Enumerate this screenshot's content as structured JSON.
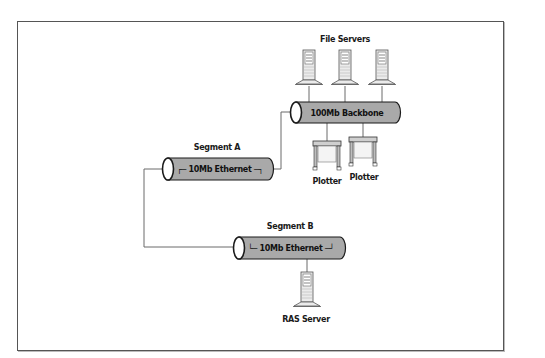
{
  "diagram": {
    "colors": {
      "pipe_fill": "#a9a9a9",
      "pipe_stroke": "#1a1a1a",
      "line": "#666666",
      "device_fill": "#e6e6e6",
      "frame": "#555555"
    },
    "groups": {
      "file_servers": {
        "label": "File Servers"
      }
    },
    "segments": [
      {
        "id": "backbone",
        "name_label": "",
        "pipe_label": "100Mb Backbone"
      },
      {
        "id": "segment_a",
        "name_label": "Segment A",
        "pipe_label": "┌─ 10Mb Ethernet ─┐"
      },
      {
        "id": "segment_b",
        "name_label": "Segment B",
        "pipe_label": "└─ 10Mb Ethernet ─┘"
      }
    ],
    "devices": [
      {
        "id": "file_server_1",
        "type": "server-icon",
        "label": ""
      },
      {
        "id": "file_server_2",
        "type": "server-icon",
        "label": ""
      },
      {
        "id": "file_server_3",
        "type": "server-icon",
        "label": ""
      },
      {
        "id": "plotter_1",
        "type": "plotter-icon",
        "label": "Plotter"
      },
      {
        "id": "plotter_2",
        "type": "plotter-icon",
        "label": "Plotter"
      },
      {
        "id": "ras_server",
        "type": "server-icon",
        "label": "RAS Server"
      }
    ],
    "connections": [
      {
        "from": "file_server_1",
        "to": "backbone"
      },
      {
        "from": "file_server_2",
        "to": "backbone"
      },
      {
        "from": "file_server_3",
        "to": "backbone"
      },
      {
        "from": "plotter_1",
        "to": "backbone"
      },
      {
        "from": "plotter_2",
        "to": "backbone"
      },
      {
        "from": "segment_a",
        "to": "backbone"
      },
      {
        "from": "segment_a",
        "to": "segment_b"
      },
      {
        "from": "ras_server",
        "to": "segment_b"
      }
    ]
  }
}
